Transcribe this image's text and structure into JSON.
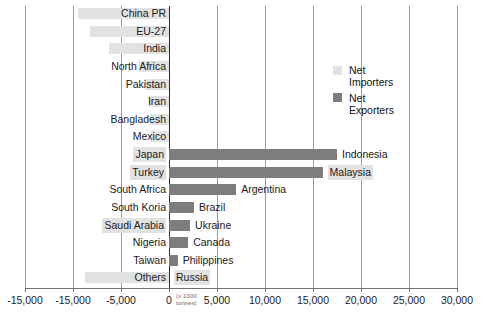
{
  "chart_data": {
    "type": "bar",
    "orientation": "horizontal",
    "title": "",
    "xlabel": "(x 1000 tonnes)",
    "ylabel": "",
    "xlim": [
      -15000,
      30000
    ],
    "xticks": [
      -15000,
      -15000,
      -5000,
      0,
      5000,
      10000,
      15000,
      20000,
      25000,
      30000
    ],
    "xtick_labels": [
      "-15,000",
      "-15,000",
      "-5,000",
      "0",
      "5,000",
      "10,000",
      "15,000",
      "20,000",
      "25,000",
      "30,000"
    ],
    "grid": true,
    "legend_position": "upper right",
    "legend": [
      {
        "name": "Net Importers",
        "color": "#e2e2e2",
        "line1": "Net",
        "line2": "Importers"
      },
      {
        "name": "Net Exporters",
        "color": "#7d7d7d",
        "line1": "Net",
        "line2": "Exporters"
      }
    ],
    "note": "Axis tick label '-15,000' is printed twice in the source figure; second one is positioned where -10,000 would fall.",
    "rows": [
      {
        "left_label": "China PR",
        "right_label": "",
        "value": -9500,
        "series": "Net Importers",
        "left_highlight": false,
        "right_highlight": false
      },
      {
        "left_label": "EU-27",
        "right_label": "",
        "value": -8200,
        "series": "Net Importers",
        "left_highlight": false,
        "right_highlight": false
      },
      {
        "left_label": "India",
        "right_label": "",
        "value": -6300,
        "series": "Net Importers",
        "left_highlight": false,
        "right_highlight": false
      },
      {
        "left_label": "North Africa",
        "right_label": "",
        "value": -3100,
        "series": "Net Importers",
        "left_highlight": false,
        "right_highlight": false
      },
      {
        "left_label": "Pakistan",
        "right_label": "",
        "value": -2500,
        "series": "Net Importers",
        "left_highlight": false,
        "right_highlight": false
      },
      {
        "left_label": "Iran",
        "right_label": "",
        "value": -2100,
        "series": "Net Importers",
        "left_highlight": false,
        "right_highlight": false
      },
      {
        "left_label": "Bangladesh",
        "right_label": "",
        "value": -2000,
        "series": "Net Importers",
        "left_highlight": false,
        "right_highlight": false
      },
      {
        "left_label": "Mexico",
        "right_label": "",
        "value": -1900,
        "series": "Net Importers",
        "left_highlight": false,
        "right_highlight": false
      },
      {
        "left_label": "Japan",
        "right_label": "Indonesia",
        "value": 17500,
        "series": "Net Exporters",
        "left_highlight": true,
        "right_highlight": false
      },
      {
        "left_label": "Turkey",
        "right_label": "Malaysia",
        "value": 16000,
        "series": "Net Exporters",
        "left_highlight": true,
        "right_highlight": true
      },
      {
        "left_label": "South Africa",
        "right_label": "Argentina",
        "value": 7000,
        "series": "Net Exporters",
        "left_highlight": false,
        "right_highlight": false
      },
      {
        "left_label": "South Koria",
        "right_label": "Brazil",
        "value": 2600,
        "series": "Net Exporters",
        "left_highlight": false,
        "right_highlight": false
      },
      {
        "left_label": "Saudi Arabia",
        "right_label": "Ukraine",
        "value": 2200,
        "series": "Net Exporters",
        "left_highlight": true,
        "right_highlight": false
      },
      {
        "left_label": "Nigeria",
        "right_label": "Canada",
        "value": 2000,
        "series": "Net Exporters",
        "left_highlight": false,
        "right_highlight": false
      },
      {
        "left_label": "Taiwan",
        "right_label": "Philippines",
        "value": 900,
        "series": "Net Exporters",
        "left_highlight": false,
        "right_highlight": false
      },
      {
        "left_label": "Others",
        "right_label": "Russia",
        "value": -8700,
        "series": "Net Importers",
        "left_highlight": false,
        "right_highlight": true
      }
    ]
  },
  "colors": {
    "importers": "#e2e2e2",
    "exporters": "#7d7d7d",
    "axis": "#6f6f6f",
    "zero_axis": "#2b2b2b",
    "grid": "#9a9a9a",
    "text": "#1a1a1a",
    "background": "#ffffff"
  }
}
